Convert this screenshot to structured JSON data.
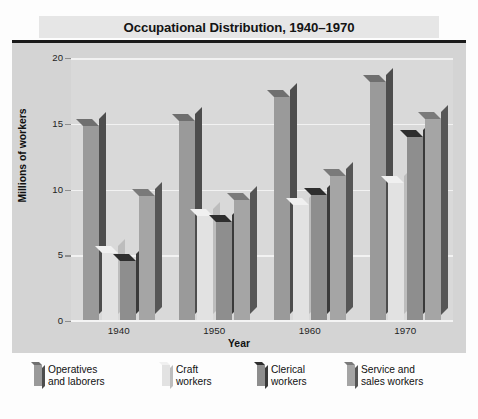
{
  "chart_data": {
    "type": "bar",
    "title": "Occupational Distribution, 1940–1970",
    "xlabel": "Year",
    "ylabel": "Millions of workers",
    "categories": [
      "1940",
      "1950",
      "1960",
      "1970"
    ],
    "ylim": [
      0,
      20
    ],
    "yticks": [
      0,
      5,
      10,
      15,
      20
    ],
    "ytick_labels": [
      "0",
      "5",
      "10",
      "15",
      "20"
    ],
    "grid": true,
    "legend_position": "bottom",
    "style": "3d-grouped-bars",
    "series": [
      {
        "name": "Operatives and laborers",
        "legend_line1": "Operatives",
        "legend_line2": "and laborers",
        "color": "#9a9a9a",
        "side_color": "#4d4d4d",
        "top_color": "#6f6f6f",
        "values": [
          14.8,
          15.2,
          17.0,
          18.2
        ]
      },
      {
        "name": "Craft workers",
        "legend_line1": "Craft",
        "legend_line2": "workers",
        "color": "#e2e2e2",
        "side_color": "#bdbdbd",
        "top_color": "#f0f0f0",
        "values": [
          5.2,
          8.0,
          8.8,
          10.5
        ]
      },
      {
        "name": "Clerical workers",
        "legend_line1": "Clerical",
        "legend_line2": "workers",
        "color": "#8e8e8e",
        "side_color": "#3a3a3a",
        "top_color": "#2e2e2e",
        "values": [
          4.6,
          7.5,
          9.6,
          14.0
        ]
      },
      {
        "name": "Service and sales workers",
        "legend_line1": "Service and",
        "legend_line2": "sales workers",
        "color": "#a5a5a5",
        "side_color": "#565656",
        "top_color": "#7a7a7a",
        "values": [
          9.5,
          9.2,
          11.0,
          15.4
        ]
      }
    ]
  },
  "colors": {
    "title_band": "#e6e6e6",
    "plot_frame": "#d4d4d4",
    "plot_area": "#d9d9d9",
    "gridline": "#f2f2f2",
    "rule": "#1a1a1a",
    "text": "#111111",
    "page_background": "#fdfdfd"
  }
}
